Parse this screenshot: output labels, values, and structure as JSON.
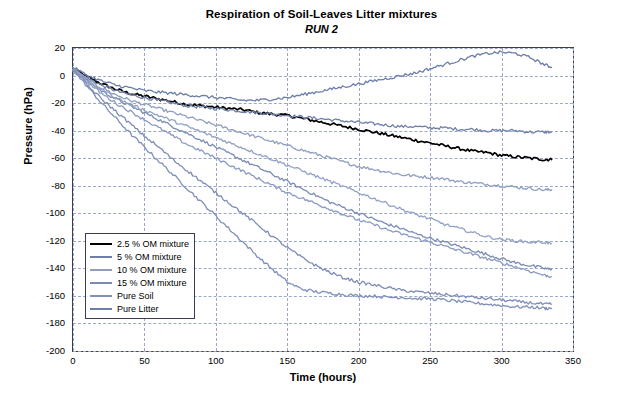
{
  "chart_data": {
    "type": "line",
    "title": "Respiration of Soil-Leaves Litter mixtures",
    "subtitle": "RUN 2",
    "xlabel": "Time (hours)",
    "ylabel": "Pressure (hPa)",
    "xlim": [
      0,
      350
    ],
    "ylim": [
      -200,
      20
    ],
    "xticks": [
      0,
      50,
      100,
      150,
      200,
      250,
      300,
      350
    ],
    "yticks": [
      20,
      0,
      -20,
      -40,
      -60,
      -80,
      -100,
      -120,
      -140,
      -160,
      -180,
      -200
    ],
    "grid": true,
    "legend_position": "inside-bottom-left",
    "series": [
      {
        "name": "2.5 % OM mixture",
        "color": "#000000",
        "x": [
          0,
          10,
          20,
          30,
          40,
          50,
          60,
          70,
          80,
          90,
          100,
          110,
          120,
          130,
          140,
          150,
          160,
          170,
          180,
          190,
          200,
          210,
          220,
          230,
          240,
          250,
          260,
          270,
          280,
          290,
          300,
          310,
          320,
          330,
          335
        ],
        "y": [
          5,
          -1,
          -6,
          -10,
          -13,
          -15,
          -17,
          -19,
          -21,
          -22,
          -23,
          -24,
          -25,
          -27,
          -28,
          -29,
          -31,
          -33,
          -35,
          -37,
          -39,
          -41,
          -43,
          -45,
          -47,
          -49,
          -51,
          -53,
          -55,
          -56,
          -58,
          -59,
          -60,
          -61,
          -61
        ]
      },
      {
        "name": "5 % OM mixture",
        "color": "#6f7fa8",
        "x": [
          0,
          10,
          20,
          30,
          40,
          50,
          60,
          70,
          80,
          90,
          100,
          110,
          120,
          130,
          140,
          150,
          160,
          170,
          180,
          190,
          200,
          210,
          220,
          230,
          240,
          250,
          260,
          270,
          280,
          290,
          300,
          310,
          320,
          330,
          335
        ],
        "y": [
          5,
          -2,
          -7,
          -11,
          -14,
          -16,
          -18,
          -20,
          -22,
          -23,
          -24,
          -25,
          -26,
          -27,
          -28,
          -29,
          -30,
          -31,
          -32,
          -33,
          -34,
          -35,
          -36,
          -37,
          -37,
          -38,
          -38,
          -39,
          -39,
          -40,
          -40,
          -40,
          -41,
          -41,
          -41
        ]
      },
      {
        "name": "10 % OM mixture",
        "color": "#8e9ec0",
        "x": [
          0,
          10,
          20,
          30,
          40,
          50,
          60,
          70,
          80,
          90,
          100,
          110,
          120,
          130,
          140,
          150,
          160,
          170,
          180,
          190,
          200,
          210,
          220,
          230,
          240,
          250,
          260,
          270,
          280,
          290,
          300,
          310,
          320,
          330,
          335
        ],
        "y": [
          5,
          -3,
          -9,
          -14,
          -18,
          -21,
          -24,
          -27,
          -30,
          -33,
          -36,
          -39,
          -42,
          -45,
          -48,
          -51,
          -54,
          -57,
          -60,
          -63,
          -66,
          -68,
          -70,
          -72,
          -73,
          -74,
          -75,
          -77,
          -78,
          -79,
          -80,
          -81,
          -82,
          -83,
          -83
        ]
      },
      {
        "name": "15 % OM mixture",
        "color": "#7a8bb5",
        "x": [
          0,
          10,
          20,
          30,
          40,
          50,
          60,
          70,
          80,
          90,
          100,
          110,
          120,
          130,
          140,
          150,
          160,
          170,
          180,
          190,
          200,
          210,
          220,
          230,
          240,
          250,
          260,
          270,
          280,
          290,
          300,
          310,
          320,
          330,
          335
        ],
        "y": [
          5,
          -4,
          -11,
          -17,
          -22,
          -27,
          -32,
          -37,
          -42,
          -47,
          -52,
          -57,
          -62,
          -67,
          -72,
          -77,
          -82,
          -87,
          -92,
          -96,
          -100,
          -104,
          -108,
          -111,
          -115,
          -118,
          -121,
          -124,
          -127,
          -130,
          -133,
          -136,
          -138,
          -140,
          -141
        ]
      },
      {
        "name": "Pure Soil",
        "color": "#7f8fb8",
        "x": [
          0,
          10,
          20,
          30,
          40,
          50,
          60,
          70,
          80,
          90,
          100,
          110,
          120,
          130,
          140,
          150,
          160,
          170,
          180,
          190,
          200,
          210,
          220,
          230,
          240,
          250,
          260,
          270,
          280,
          290,
          300,
          310,
          320,
          330,
          335
        ],
        "y": [
          4,
          -8,
          -20,
          -31,
          -42,
          -52,
          -62,
          -72,
          -82,
          -92,
          -102,
          -112,
          -122,
          -132,
          -141,
          -150,
          -155,
          -157,
          -158,
          -159,
          -160,
          -160,
          -161,
          -161,
          -162,
          -162,
          -163,
          -164,
          -165,
          -166,
          -167,
          -168,
          -168,
          -169,
          -169
        ]
      },
      {
        "name": "Pure Litter",
        "color": "#6b7da9",
        "x": [
          0,
          10,
          20,
          30,
          40,
          50,
          60,
          70,
          80,
          90,
          100,
          110,
          120,
          130,
          140,
          150,
          160,
          170,
          180,
          190,
          200,
          210,
          220,
          230,
          240,
          250,
          260,
          270,
          280,
          290,
          300,
          310,
          320,
          330,
          335
        ],
        "y": [
          6,
          0,
          -4,
          -7,
          -9,
          -11,
          -12,
          -13,
          -14,
          -15,
          -16,
          -17,
          -18,
          -18,
          -17,
          -16,
          -14,
          -12,
          -10,
          -8,
          -6,
          -4,
          -2,
          0,
          2,
          5,
          8,
          11,
          14,
          16,
          17,
          16,
          13,
          8,
          6
        ]
      },
      {
        "name": "extra-a",
        "color": "#8b9ac2",
        "hidden_from_legend": true,
        "x": [
          0,
          10,
          20,
          30,
          40,
          50,
          60,
          70,
          80,
          90,
          100,
          110,
          120,
          130,
          140,
          150,
          160,
          170,
          180,
          190,
          200,
          210,
          220,
          230,
          240,
          250,
          260,
          270,
          280,
          290,
          300,
          310,
          320,
          330,
          335
        ],
        "y": [
          5,
          -5,
          -13,
          -20,
          -26,
          -32,
          -38,
          -44,
          -50,
          -55,
          -60,
          -65,
          -70,
          -75,
          -80,
          -85,
          -89,
          -93,
          -97,
          -101,
          -105,
          -108,
          -112,
          -115,
          -118,
          -121,
          -124,
          -127,
          -130,
          -133,
          -136,
          -139,
          -142,
          -145,
          -146
        ]
      },
      {
        "name": "extra-b",
        "color": "#92a1c6",
        "hidden_from_legend": true,
        "x": [
          0,
          10,
          20,
          30,
          40,
          50,
          60,
          70,
          80,
          90,
          100,
          110,
          120,
          130,
          140,
          150,
          160,
          170,
          180,
          190,
          200,
          210,
          220,
          230,
          240,
          250,
          260,
          270,
          280,
          290,
          300,
          310,
          320,
          330,
          335
        ],
        "y": [
          5,
          -4,
          -10,
          -16,
          -21,
          -25,
          -29,
          -33,
          -37,
          -41,
          -45,
          -49,
          -53,
          -57,
          -61,
          -65,
          -69,
          -73,
          -77,
          -81,
          -85,
          -89,
          -93,
          -97,
          -101,
          -104,
          -108,
          -111,
          -114,
          -117,
          -119,
          -120,
          -121,
          -121,
          -122
        ]
      },
      {
        "name": "extra-c",
        "color": "#7d8db6",
        "hidden_from_legend": true,
        "x": [
          0,
          10,
          20,
          30,
          40,
          50,
          60,
          70,
          80,
          90,
          100,
          110,
          120,
          130,
          140,
          150,
          160,
          170,
          180,
          190,
          200,
          210,
          220,
          230,
          240,
          250,
          260,
          270,
          280,
          290,
          300,
          310,
          320,
          330,
          335
        ],
        "y": [
          5,
          -7,
          -17,
          -26,
          -35,
          -44,
          -52,
          -61,
          -69,
          -77,
          -85,
          -93,
          -101,
          -109,
          -117,
          -125,
          -132,
          -138,
          -143,
          -147,
          -150,
          -152,
          -154,
          -156,
          -157,
          -158,
          -159,
          -160,
          -161,
          -162,
          -163,
          -164,
          -165,
          -166,
          -166
        ]
      }
    ],
    "legend_entries": [
      {
        "label": "2.5 % OM mixture",
        "color": "#000000"
      },
      {
        "label": "5 % OM mixture",
        "color": "#6f7fa8"
      },
      {
        "label": "10 % OM mixture",
        "color": "#8e9ec0"
      },
      {
        "label": "15 % OM mixture",
        "color": "#7a8bb5"
      },
      {
        "label": "Pure Soil",
        "color": "#7f8fb8"
      },
      {
        "label": "Pure Litter",
        "color": "#6b7da9"
      }
    ]
  }
}
